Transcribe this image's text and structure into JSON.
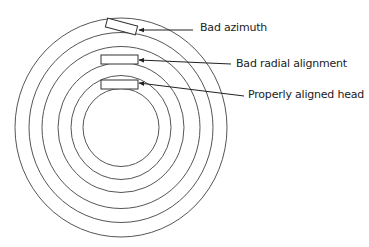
{
  "diagram": {
    "type": "disk-tracks-head-alignment",
    "center": [
      121,
      127.5
    ],
    "tracks": [
      {
        "rx": 106,
        "ry": 109.5
      },
      {
        "rx": 92,
        "ry": 95
      },
      {
        "rx": 79,
        "ry": 81
      },
      {
        "rx": 63,
        "ry": 65
      },
      {
        "rx": 50,
        "ry": 52
      },
      {
        "rx": 38,
        "ry": 39
      }
    ],
    "stroke_color": "#555555",
    "text_color": "#222222",
    "heads": [
      {
        "id": "bad-azimuth",
        "label": "Bad azimuth",
        "box": {
          "x": 106,
          "y": 22,
          "w": 31,
          "h": 9,
          "rotate": 15
        },
        "arrow": {
          "from": [
            193,
            30
          ],
          "to": [
            139,
            30
          ]
        }
      },
      {
        "id": "bad-radial-alignment",
        "label": "Bad radial alignment",
        "box": {
          "x": 101,
          "y": 55,
          "w": 37,
          "h": 9,
          "rotate": 0
        },
        "arrow": {
          "from": [
            231,
            64
          ],
          "to": [
            139,
            60
          ]
        }
      },
      {
        "id": "properly-aligned-head",
        "label": "Properly aligned head",
        "box": {
          "x": 101,
          "y": 80,
          "w": 37,
          "h": 9,
          "rotate": 0
        },
        "arrow": {
          "from": [
            244,
            96
          ],
          "to": [
            139,
            83
          ]
        }
      }
    ]
  }
}
